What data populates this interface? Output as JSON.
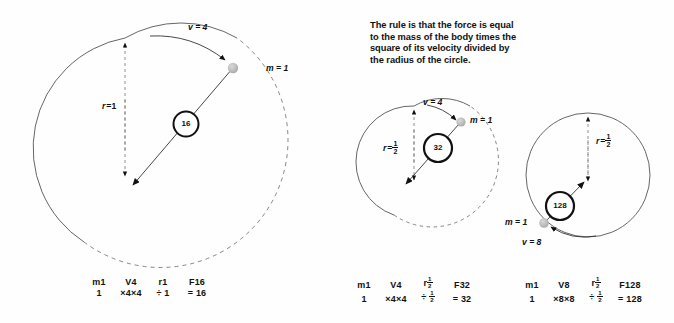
{
  "page": {
    "background": "#fefefe",
    "ink": "#111111",
    "mass_dot_color": "#b9b9b9"
  },
  "rule_text": {
    "lines": [
      "The rule is that the force is equal",
      "to the mass of the body times the",
      "square of its velocity divided by",
      "the radius of the circle."
    ]
  },
  "diagrams": [
    {
      "id": "diagram-1",
      "velocity_label": "v = 4",
      "mass_label": "m = 1",
      "radius_label_symbol": "r",
      "radius_label_eq": "=",
      "radius_label_value": "1",
      "radius_is_fraction": false,
      "force_circle_value": "16",
      "formula": {
        "mass_header": "m1",
        "velocity_header": "V4",
        "radius_header_symbol": "r",
        "radius_header_value": "1",
        "radius_header_is_fraction": false,
        "force_header": "F16",
        "mass_value": "1",
        "mul1": "×",
        "v_a": "4",
        "mul2": "×",
        "v_b": "4",
        "div": "÷",
        "radius_value": "1",
        "radius_value_is_fraction": false,
        "equals": "=",
        "result": "16"
      }
    },
    {
      "id": "diagram-2",
      "velocity_label": "v = 4",
      "mass_label": "m = 1",
      "radius_label_symbol": "r",
      "radius_label_eq": "=",
      "radius_label_value": "1/2",
      "radius_numerator": "1",
      "radius_denominator": "2",
      "radius_is_fraction": true,
      "force_circle_value": "32",
      "formula": {
        "mass_header": "m1",
        "velocity_header": "V4",
        "radius_header_symbol": "r",
        "radius_header_numerator": "1",
        "radius_header_denominator": "2",
        "radius_header_is_fraction": true,
        "force_header": "F32",
        "mass_value": "1",
        "mul1": "×",
        "v_a": "4",
        "mul2": "×",
        "v_b": "4",
        "div": "÷",
        "radius_numerator": "1",
        "radius_denominator": "2",
        "radius_value_is_fraction": true,
        "equals": "=",
        "result": "32"
      }
    },
    {
      "id": "diagram-3",
      "velocity_label": "v = 8",
      "mass_label": "m = 1",
      "radius_label_symbol": "r",
      "radius_label_eq": "=",
      "radius_label_value": "1/2",
      "radius_numerator": "1",
      "radius_denominator": "2",
      "radius_is_fraction": true,
      "force_circle_value": "128",
      "formula": {
        "mass_header": "m1",
        "velocity_header": "V8",
        "radius_header_symbol": "r",
        "radius_header_numerator": "1",
        "radius_header_denominator": "2",
        "radius_header_is_fraction": true,
        "force_header": "F128",
        "mass_value": "1",
        "mul1": "×",
        "v_a": "8",
        "mul2": "×",
        "v_b": "8",
        "div": "÷",
        "radius_numerator": "1",
        "radius_denominator": "2",
        "radius_value_is_fraction": true,
        "equals": "=",
        "result": "128"
      }
    }
  ]
}
